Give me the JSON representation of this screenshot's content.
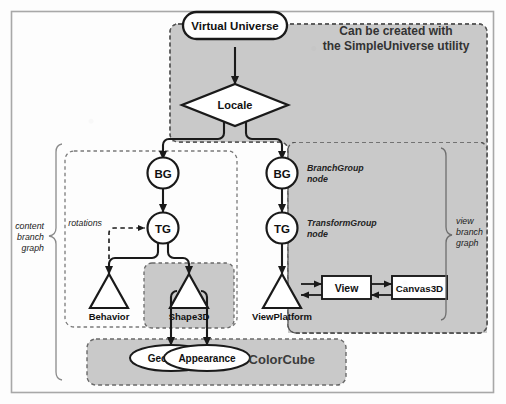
{
  "diagram": {
    "colors": {
      "gray_region": "#c9c9c9",
      "white_node": "#ffffff",
      "stroke": "#1a1a1a",
      "frame": "#9a9a9a",
      "dashed_border": "#6f6f6f",
      "text": "#111111"
    },
    "annotation_top": {
      "line1": "Can be created with",
      "line2": "the SimpleUniverse utility"
    },
    "nodes": {
      "virtual_universe": "Virtual Universe",
      "locale": "Locale",
      "bg_left": "BG",
      "tg_left": "TG",
      "bg_right": "BG",
      "tg_right": "TG",
      "behavior": "Behavior",
      "shape3d": "Shape3D",
      "view_platform": "ViewPlatform",
      "view": "View",
      "canvas3d": "Canvas3D",
      "geometry": "Geometry",
      "appearance": "Appearance"
    },
    "side_notes": {
      "branchgroup_line1": "BranchGroup",
      "branchgroup_line2": "node",
      "transformgroup_line1": "TransformGroup",
      "transformgroup_line2": "node"
    },
    "edge_labels": {
      "rotations": "rotations"
    },
    "brackets": {
      "content_branch": [
        "content",
        "branch",
        "graph"
      ],
      "view_branch": [
        "view",
        "branch",
        "graph"
      ]
    },
    "group_labels": {
      "colorcube": "ColorCube"
    }
  }
}
